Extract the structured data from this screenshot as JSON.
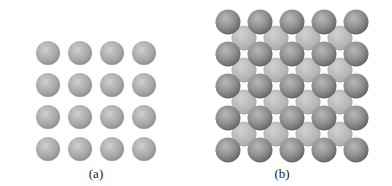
{
  "panels": [
    {
      "label": "(a)",
      "label_pos": [
        96,
        166
      ],
      "type": "simple-square-layer",
      "rows": 4,
      "cols": 4,
      "origin": [
        48,
        53
      ],
      "spacing": 32,
      "radius": 12
    },
    {
      "label": "(b)",
      "label_pos": [
        282,
        166
      ],
      "type": "two-layer-square-packing",
      "front": {
        "rows": 5,
        "cols": 5,
        "origin": [
          228,
          22
        ],
        "spacing": 32,
        "radius": 12.5
      },
      "back": {
        "rows": 4,
        "cols": 4,
        "origin": [
          244,
          38
        ],
        "spacing": 32,
        "radius": 12.5
      }
    }
  ],
  "colors": {
    "sphere_light": "#c8c8c8",
    "sphere_mid": "#a6a6a6",
    "sphere_dark": "#7e7e7e",
    "back_light": "#cfcfcf",
    "back_mid": "#b4b4b4",
    "front_dark": "#6e6e6e"
  }
}
